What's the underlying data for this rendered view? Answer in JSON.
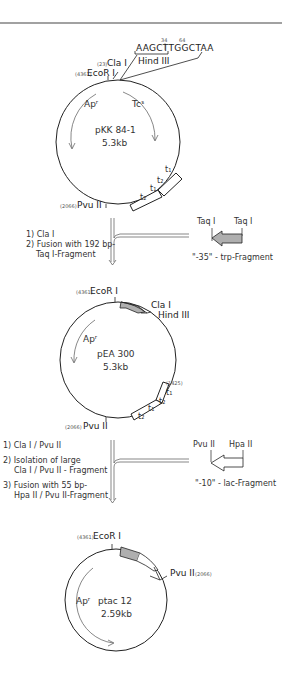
{
  "plasmid1": {
    "name": "pKK 84-1",
    "size": "5.3kb",
    "sites": {
      "ecori": {
        "pos": "(4361)",
        "label": "EcoR I"
      },
      "clai": {
        "pos": "(23)",
        "label": "Cla I"
      },
      "hindiii": {
        "label": "Hind III"
      },
      "pvuii": {
        "pos": "(2066)",
        "label": "Pvu II"
      }
    },
    "sequence": "AAGCTTGGCTAA",
    "seq_pos_1": "34",
    "seq_pos_2": "64",
    "genes": {
      "amp": "Apʳ",
      "tet": "Tcˢ"
    },
    "terminators": [
      "t₁",
      "t₂",
      "t₁",
      "t₂"
    ]
  },
  "step1": {
    "items": [
      "1)  Cla I",
      "2)  Fusion with 192 bp-",
      "Taq I-Fragment"
    ],
    "fragment": {
      "site_left": "Taq I",
      "site_right": "Taq I",
      "label": "\"-35\" - trp-Fragment"
    }
  },
  "plasmid2": {
    "name": "pEA 300",
    "size": "5.3kb",
    "sites": {
      "ecori": {
        "pos": "(4361)",
        "label": "EcoR I"
      },
      "clai": {
        "label": "Cla I"
      },
      "hindiii": {
        "label": "Hind III"
      },
      "pvuii": {
        "pos": "(2066)",
        "label": "Pvu II"
      },
      "t_pos": "(1425)"
    },
    "genes": {
      "amp": "Apʳ"
    },
    "terminators": [
      "t₁",
      "t₂",
      "t₁",
      "t₂"
    ]
  },
  "step2": {
    "items": [
      "1)  Cla I / Pvu II",
      "2)  Isolation of large",
      "Cla I / Pvu II - Fragment",
      "3)  Fusion with 55 bp-",
      "Hpa II / Pvu II-Fragment"
    ],
    "fragment": {
      "site_left": "Pvu II",
      "site_right": "Hpa II",
      "label": "\"-10\" - lac-Fragment"
    }
  },
  "plasmid3": {
    "name": "ptac 12",
    "size": "2.59kb",
    "sites": {
      "ecori": {
        "pos": "(4361)",
        "label": "EcoR I"
      },
      "pvuii": {
        "label": "Pvu II",
        "pos": "(2066)"
      }
    },
    "genes": {
      "amp": "Apʳ"
    }
  }
}
